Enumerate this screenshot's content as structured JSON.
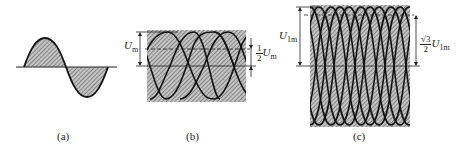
{
  "figure": {
    "panels": [
      {
        "id": "a",
        "caption": "(a)",
        "description": "single-phase half-shaded sine wave"
      },
      {
        "id": "b",
        "caption": "(b)",
        "description": "three-phase half-wave superimposed sinusoids",
        "labels": {
          "amplitude": "U",
          "amplitude_sub": "m",
          "ripple_num": "1",
          "ripple_den": "2",
          "ripple_sym": "U",
          "ripple_sub": "m"
        }
      },
      {
        "id": "c",
        "caption": "(c)",
        "description": "six-phase superimposed sinusoids",
        "labels": {
          "amplitude": "U",
          "amplitude_sub": "1m",
          "ripple_num": "√3",
          "ripple_den": "2",
          "ripple_sym": "U",
          "ripple_sub": "1m"
        }
      }
    ],
    "colors": {
      "stroke": "#1a1a1a",
      "hatch_bg": "#bdbdbd",
      "hatch_line": "#555555",
      "background": "#ffffff"
    }
  }
}
